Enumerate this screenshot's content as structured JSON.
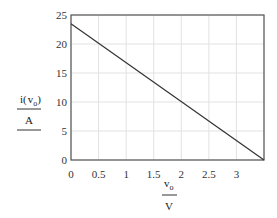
{
  "chart_data": {
    "type": "line",
    "title": "",
    "xlabel": "v_o / V",
    "ylabel": "i(v_o) / A",
    "xlim": [
      0,
      3.5
    ],
    "ylim": [
      0,
      25
    ],
    "x_ticks": [
      "0",
      "0.5",
      "1",
      "1.5",
      "2",
      "2.5",
      "3"
    ],
    "y_ticks": [
      "0",
      "5",
      "10",
      "15",
      "20",
      "25"
    ],
    "grid": true,
    "legend": null,
    "series": [
      {
        "name": "i(v_o)",
        "x": [
          0,
          3.5
        ],
        "y": [
          23.5,
          0
        ],
        "color": "#333333"
      }
    ]
  },
  "labels": {
    "y_num_main": "i",
    "y_num_open": "(",
    "y_num_var": "v",
    "y_num_sub": "o",
    "y_num_close": ")",
    "y_den": "A",
    "x_num_var": "v",
    "x_num_sub": "o",
    "x_den": "V"
  }
}
